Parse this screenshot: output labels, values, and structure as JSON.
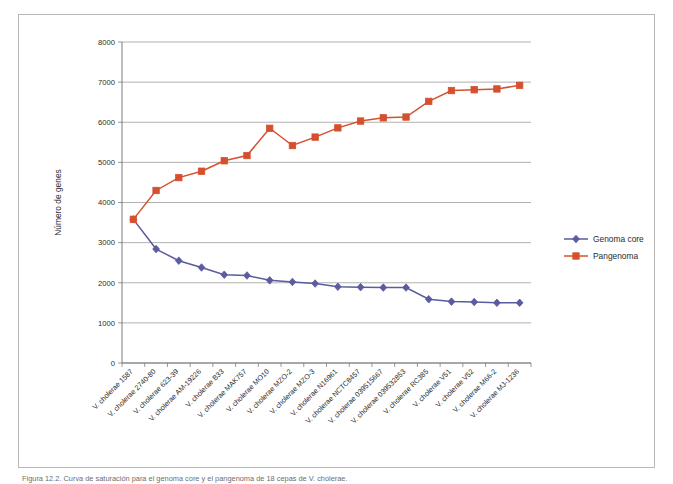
{
  "figure": {
    "caption": "Figura 12.2.  Curva de saturación para el genoma core y el pangenoma de 18 cepas de V. cholerae."
  },
  "legend": {
    "position": "right",
    "items": [
      {
        "label": "Genoma core",
        "color": "#5B5B9F",
        "marker": "diamond"
      },
      {
        "label": "Pangenoma",
        "color": "#D4502E",
        "marker": "square"
      }
    ]
  },
  "axes": {
    "y_title": "Número de genes",
    "y_ticks": [
      "0",
      "1000",
      "2000",
      "3000",
      "4000",
      "5000",
      "6000",
      "7000",
      "8000"
    ]
  },
  "chart_data": {
    "type": "line",
    "title": "",
    "xlabel": "",
    "ylabel": "Número de genes",
    "ylim": [
      0,
      8000
    ],
    "ytick_step": 1000,
    "grid": true,
    "legend_position": "right",
    "categories": [
      "V. cholerae 1587",
      "V. cholerae 2740-80",
      "V. cholerae 623-39",
      "V. cholerae AM-19226",
      "V. cholerae B33",
      "V. cholerae MAK757",
      "V. cholerae MO10",
      "V. cholerae MZO-2",
      "V. cholerae MZO-3",
      "V. cholerae N16961",
      "V. cholerae NCTC8457",
      "V. cholerae 039515667",
      "V. cholerae 039532853",
      "V. cholerae RC385",
      "V. cholerae V51",
      "V. cholerae V52",
      "V. cholerae M66-2",
      "V. cholerae MJ-1236"
    ],
    "series": [
      {
        "name": "Genoma core",
        "color": "#5B5B9F",
        "marker": "diamond",
        "values": [
          3580,
          2840,
          2550,
          2380,
          2200,
          2180,
          2060,
          2020,
          1980,
          1900,
          1890,
          1880,
          1880,
          1590,
          1530,
          1520,
          1500,
          1500
        ]
      },
      {
        "name": "Pangenoma",
        "color": "#D4502E",
        "marker": "square",
        "values": [
          3580,
          4300,
          4620,
          4780,
          5040,
          5170,
          5850,
          5420,
          5630,
          5860,
          6030,
          6110,
          6130,
          6520,
          6790,
          6810,
          6830,
          6920
        ]
      }
    ]
  }
}
